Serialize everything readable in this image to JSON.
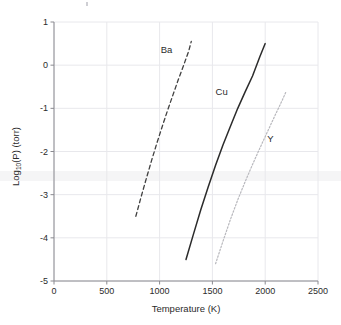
{
  "chart_data": {
    "type": "line",
    "title": "",
    "subtitle": "",
    "xlabel": "Temperature (K)",
    "ylabel": "Log10(P) (torr)",
    "ylabel_base": "Log",
    "ylabel_sub": "10",
    "ylabel_rest": "(P) (torr)",
    "xlim": [
      0,
      2500
    ],
    "ylim": [
      -5,
      1
    ],
    "xticks": [
      0,
      500,
      1000,
      1500,
      2000,
      2500
    ],
    "yticks": [
      1,
      0,
      -1,
      -2,
      -3,
      -4,
      -5
    ],
    "xtick_labels": [
      "0",
      "500",
      "1000",
      "1500",
      "2000",
      "2500"
    ],
    "ytick_labels": [
      "1",
      "0",
      "-1",
      "-2",
      "-3",
      "-4",
      "-5"
    ],
    "grid": true,
    "grid_color": "#e8e8ec",
    "legend_position": "inline-annotations",
    "series": [
      {
        "name": "Ba",
        "label": "Ba",
        "style": "dashed",
        "color": "#404040",
        "label_x": 1010,
        "label_y": 0.36,
        "x": [
          775,
          825,
          875,
          925,
          975,
          1025,
          1075,
          1125,
          1175,
          1225,
          1275,
          1300
        ],
        "y": [
          -3.5,
          -3.05,
          -2.62,
          -2.2,
          -1.8,
          -1.42,
          -1.05,
          -0.7,
          -0.35,
          -0.02,
          0.32,
          0.55
        ]
      },
      {
        "name": "Cu",
        "label": "Cu",
        "style": "solid",
        "color": "#2b2b2b",
        "label_x": 1530,
        "label_y": -0.63,
        "x": [
          1250,
          1320,
          1390,
          1460,
          1530,
          1600,
          1670,
          1740,
          1810,
          1880,
          1950,
          2000
        ],
        "y": [
          -4.5,
          -3.92,
          -3.35,
          -2.82,
          -2.32,
          -1.85,
          -1.42,
          -1.0,
          -0.62,
          -0.25,
          0.2,
          0.5
        ]
      },
      {
        "name": "Y",
        "label": "Y",
        "style": "dotted",
        "color": "#b8b8bd",
        "label_x": 2020,
        "label_y": -1.72,
        "x": [
          1530,
          1600,
          1670,
          1740,
          1810,
          1880,
          1950,
          2020,
          2090,
          2160,
          2200
        ],
        "y": [
          -4.6,
          -4.08,
          -3.58,
          -3.12,
          -2.7,
          -2.3,
          -1.92,
          -1.55,
          -1.18,
          -0.82,
          -0.6
        ]
      }
    ]
  }
}
